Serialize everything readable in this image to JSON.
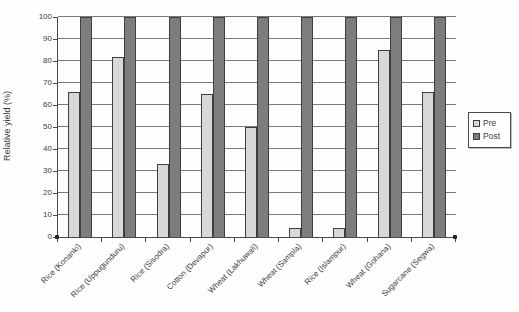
{
  "chart_data": {
    "type": "bar",
    "title": "",
    "xlabel": "",
    "ylabel": "Relative yield (%)",
    "ylim": [
      0,
      100
    ],
    "ytick_step": 10,
    "grid": true,
    "legend_position": "right",
    "categories": [
      "Rice (Konanki)",
      "Rice (Uppugunduru)",
      "Rice (Sisodra)",
      "Cotton (Devapur)",
      "Wheat (Lakhuwali)",
      "Wheat (Sampla)",
      "Rice (Islampur)",
      "Wheat (Gohana)",
      "Sugarcane (Segwa)"
    ],
    "series": [
      {
        "name": "Pre",
        "color": "#d8d8d6",
        "values": [
          66,
          82,
          33,
          65,
          50,
          4,
          4,
          85,
          66
        ]
      },
      {
        "name": "Post",
        "color": "#7d7d7d",
        "values": [
          100,
          100,
          100,
          100,
          100,
          100,
          100,
          100,
          100
        ]
      }
    ]
  },
  "colors": {
    "grid": "#7a7a7a",
    "axis": "#4a4a4a",
    "bar_border": "#3f3f3f",
    "text": "#3c3c3c",
    "legend_border": "#4a4a4a"
  }
}
